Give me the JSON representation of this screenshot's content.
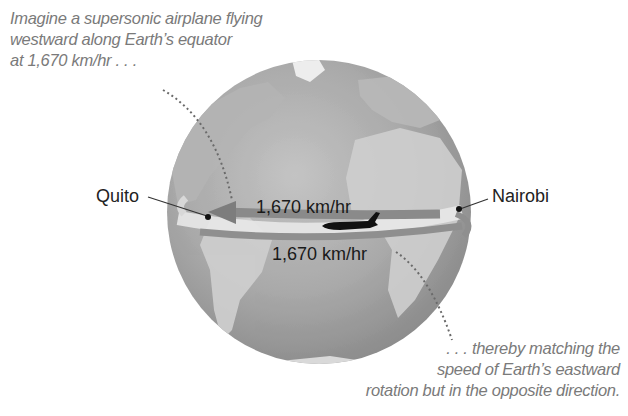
{
  "captions": {
    "top": {
      "lines": [
        "Imagine a supersonic airplane flying",
        "westward along Earth’s equator",
        "at 1,670 km/hr . . ."
      ]
    },
    "bottom": {
      "lines": [
        ". . . thereby matching the",
        "speed of Earth’s eastward",
        "rotation but in the opposite direction."
      ]
    }
  },
  "locations": {
    "west": "Quito",
    "east": "Nairobi"
  },
  "speeds": {
    "airplane": "1,670 km/hr",
    "earth_rotation": "1,670 km/hr"
  },
  "icons": {
    "globe": "globe-icon",
    "airplane": "airplane-icon",
    "westward_arrow": "arrow-left-icon",
    "eastward_arrow": "arrow-right-icon"
  },
  "colors": {
    "background": "#ffffff",
    "ocean": "#a8a8a8",
    "land": "#c9c9c9",
    "equator_band": "#e6e6e6",
    "arrow": "#8a8a8a",
    "airplane": "#111111",
    "caption_text": "#7a7a7a",
    "label_text": "#222222"
  }
}
